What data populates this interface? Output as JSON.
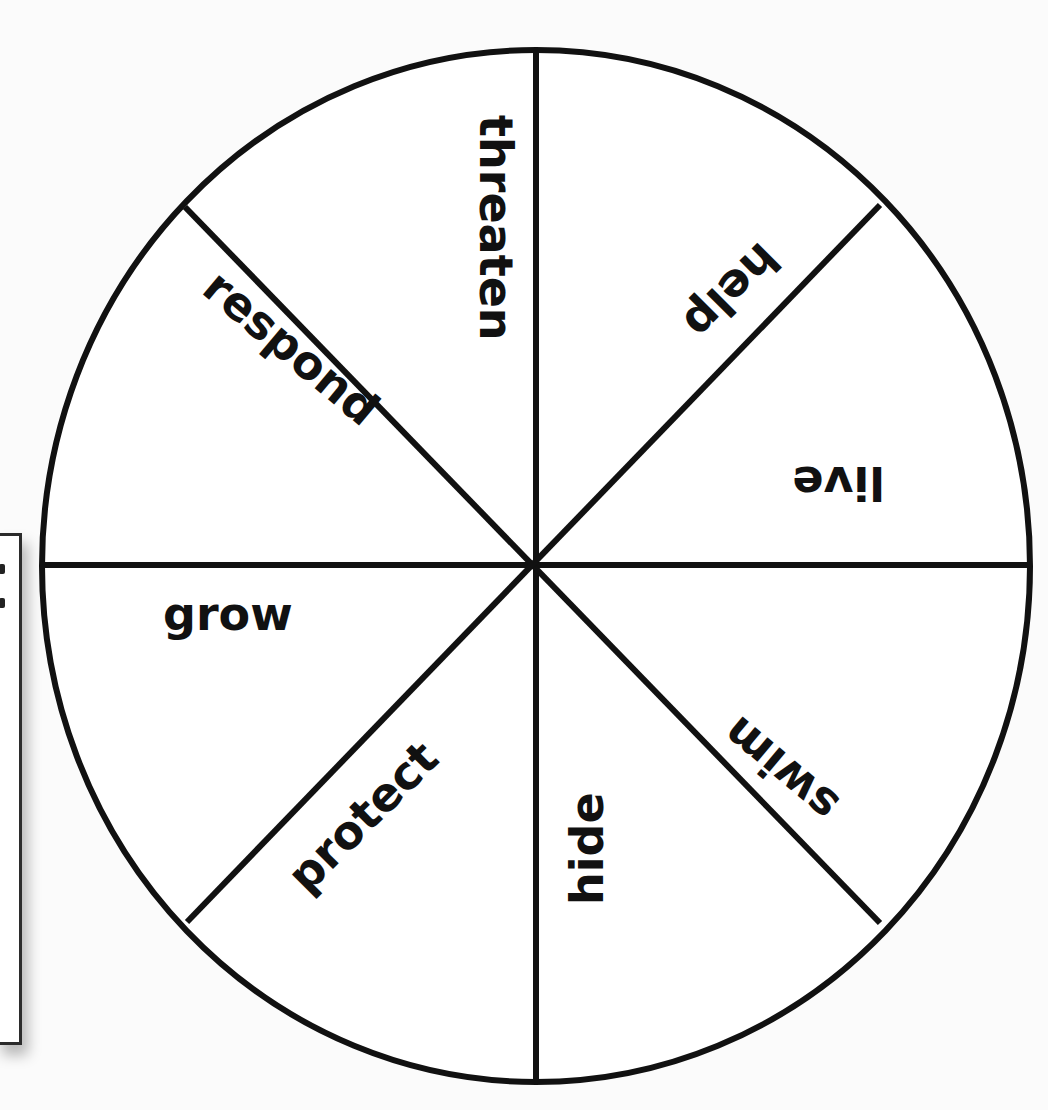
{
  "diagram": {
    "type": "word-wheel",
    "segments": 8,
    "center": [
      536,
      565
    ],
    "radius": 494,
    "line_color": "#111111",
    "background": "#fbfbfb",
    "labels": [
      {
        "text": "threaten",
        "position": "top-right-of-vertical"
      },
      {
        "text": "help",
        "position": "upper-right"
      },
      {
        "text": "live",
        "position": "right-above-horizontal"
      },
      {
        "text": "swim",
        "position": "lower-right"
      },
      {
        "text": "hide",
        "position": "bottom-right-of-vertical"
      },
      {
        "text": "protect",
        "position": "lower-left"
      },
      {
        "text": "grow",
        "position": "left-below-horizontal"
      },
      {
        "text": "respond",
        "position": "upper-left"
      }
    ]
  }
}
